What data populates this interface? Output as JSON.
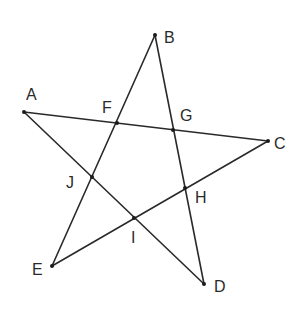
{
  "diagram": {
    "type": "pentagram",
    "stroke_color": "#2a2a2a",
    "points": {
      "A": {
        "x": 24,
        "y": 112,
        "label": "A",
        "lx": 26,
        "ly": 100
      },
      "B": {
        "x": 155,
        "y": 35,
        "label": "B",
        "lx": 164,
        "ly": 43
      },
      "C": {
        "x": 268,
        "y": 141,
        "label": "C",
        "lx": 274,
        "ly": 149
      },
      "D": {
        "x": 204,
        "y": 284,
        "label": "D",
        "lx": 214,
        "ly": 292
      },
      "E": {
        "x": 52,
        "y": 266,
        "label": "E",
        "lx": 32,
        "ly": 275
      },
      "F": {
        "x": 117,
        "y": 123,
        "label": "F",
        "lx": 102,
        "ly": 113
      },
      "G": {
        "x": 173,
        "y": 130,
        "label": "G",
        "lx": 180,
        "ly": 121
      },
      "H": {
        "x": 185,
        "y": 188,
        "label": "H",
        "lx": 195,
        "ly": 203
      },
      "I": {
        "x": 134,
        "y": 218,
        "label": "I",
        "lx": 131,
        "ly": 243
      },
      "J": {
        "x": 92,
        "y": 177,
        "label": "J",
        "lx": 66,
        "ly": 188
      }
    },
    "segments": [
      [
        "A",
        "C"
      ],
      [
        "B",
        "E"
      ],
      [
        "B",
        "D"
      ],
      [
        "A",
        "D"
      ],
      [
        "E",
        "C"
      ]
    ]
  }
}
